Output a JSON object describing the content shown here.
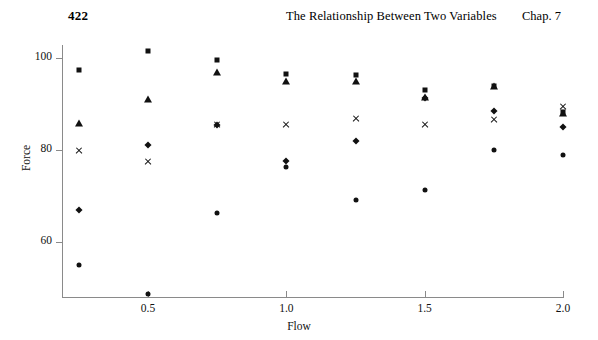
{
  "running_head": {
    "page_number": "422",
    "title": "The Relationship Between Two Variables",
    "chapter": "Chap. 7"
  },
  "chart_data": {
    "type": "scatter",
    "title": "",
    "xlabel": "Flow",
    "ylabel": "Force",
    "xlim": [
      0.125,
      2.0
    ],
    "ylim": [
      46,
      104
    ],
    "grid": false,
    "legend": "none",
    "x_ticks": [
      "0.5",
      "1.0",
      "1.5",
      "2.0"
    ],
    "x_tick_values": [
      0.5,
      1.0,
      1.5,
      2.0
    ],
    "y_ticks": [
      "100",
      "80",
      "60"
    ],
    "y_tick_values": [
      100,
      80,
      60
    ],
    "x": [
      0.25,
      0.5,
      0.75,
      1.0,
      1.25,
      1.5,
      1.75,
      2.0
    ],
    "series": [
      {
        "name": "square",
        "marker": "square",
        "values": [
          97.3,
          101.5,
          99.6,
          96.5,
          96.4,
          93.0,
          94.0,
          88.2
        ]
      },
      {
        "name": "triangle",
        "marker": "triangle",
        "values": [
          85.8,
          91.0,
          97.0,
          95.1,
          95.1,
          91.6,
          94.0,
          88.0
        ]
      },
      {
        "name": "cross",
        "marker": "cross",
        "values": [
          79.8,
          77.5,
          85.5,
          85.5,
          86.9,
          85.5,
          86.6,
          89.4
        ]
      },
      {
        "name": "diamond",
        "marker": "diamond",
        "values": [
          67.0,
          81.0,
          85.5,
          77.6,
          82.0,
          91.4,
          88.5,
          85.0
        ]
      },
      {
        "name": "circle",
        "marker": "circle",
        "values": [
          55.0,
          48.8,
          66.2,
          76.3,
          69.1,
          71.2,
          80.0,
          79.0
        ]
      }
    ]
  }
}
